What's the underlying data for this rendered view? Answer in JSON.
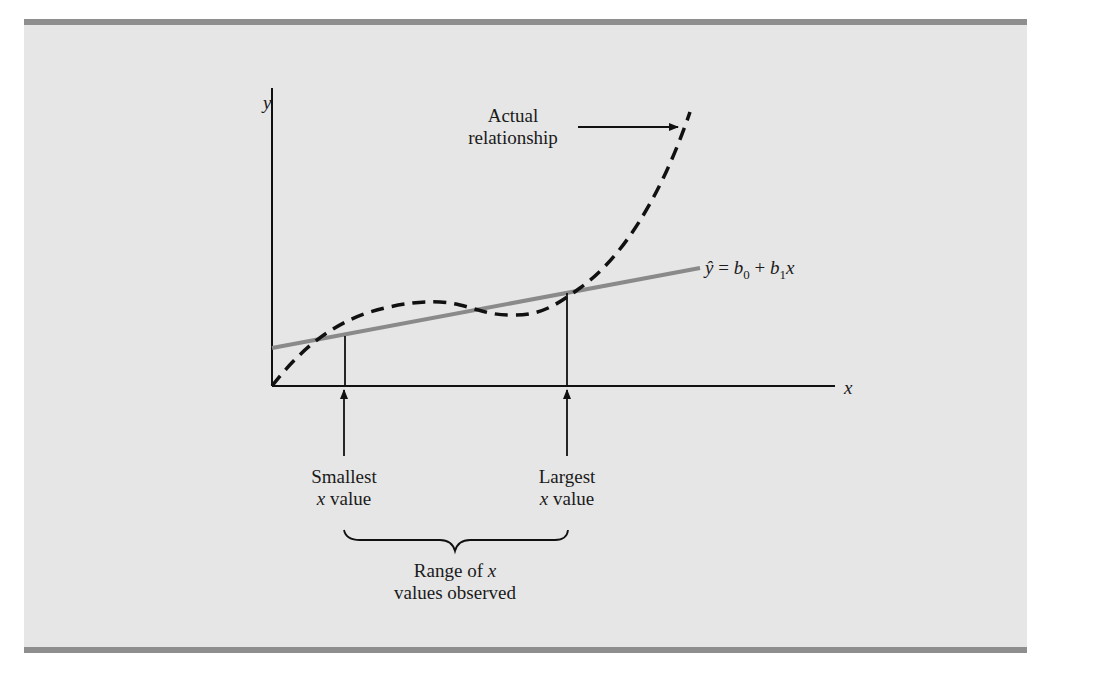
{
  "figure": {
    "axes": {
      "y_label": "y",
      "x_label": "x"
    },
    "annotations": {
      "actual_line1": "Actual",
      "actual_line2": "relationship",
      "equation": {
        "yhat": "ŷ",
        "eq": " = ",
        "b0": "b",
        "sub0": "0",
        "plus": " + ",
        "b1": "b",
        "sub1": "1",
        "x": "x"
      },
      "smallest_line1": "Smallest",
      "smallest_x": "x",
      "smallest_value": " value",
      "largest_line1": "Largest",
      "largest_x": "x",
      "largest_value": " value",
      "range_line1": "Range of ",
      "range_x": "x",
      "range_line2": "values observed"
    },
    "colors": {
      "background": "#e6e6e6",
      "rule": "#8e8e8e",
      "regression_line": "#8a8a8a",
      "curve": "#111111"
    }
  }
}
